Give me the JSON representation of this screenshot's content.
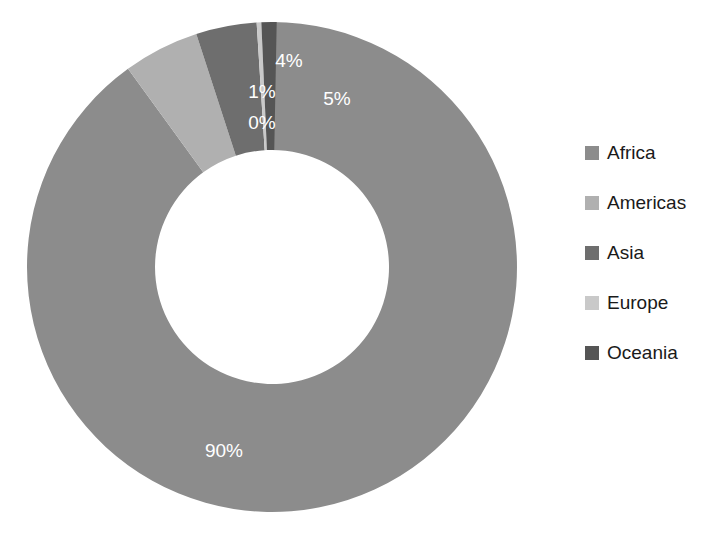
{
  "chart_data": {
    "type": "pie",
    "variant": "donut",
    "title": "",
    "subtitle": "",
    "xlabel": "",
    "ylabel": "",
    "grid": false,
    "legend_position": "right",
    "start_angle_deg": 0,
    "direction": "clockwise",
    "categories": [
      "Africa",
      "Americas",
      "Asia",
      "Europe",
      "Oceania"
    ],
    "values": [
      90,
      5,
      4,
      0,
      1
    ],
    "value_labels": [
      "90%",
      "5%",
      "4%",
      "0%",
      "1%"
    ],
    "colors": [
      "#8c8c8c",
      "#b0b0b0",
      "#6e6e6e",
      "#c9c9c9",
      "#555555"
    ],
    "slices": [
      {
        "name": "Africa",
        "value": 90,
        "label": "90%",
        "color": "#8c8c8c"
      },
      {
        "name": "Americas",
        "value": 5,
        "label": "5%",
        "color": "#b0b0b0"
      },
      {
        "name": "Asia",
        "value": 4,
        "label": "4%",
        "color": "#6e6e6e"
      },
      {
        "name": "Europe",
        "value": 0,
        "label": "0%",
        "color": "#c9c9c9"
      },
      {
        "name": "Oceania",
        "value": 1,
        "label": "1%",
        "color": "#555555"
      }
    ],
    "label_positions": [
      {
        "label": "90%",
        "x": 224,
        "y": 452
      },
      {
        "label": "5%",
        "x": 337,
        "y": 100
      },
      {
        "label": "4%",
        "x": 289,
        "y": 62
      },
      {
        "label": "0%",
        "x": 262,
        "y": 124
      },
      {
        "label": "1%",
        "x": 262,
        "y": 93
      }
    ],
    "geometry": {
      "center_x": 272,
      "center_y": 267,
      "outer_radius": 245,
      "inner_radius": 117
    }
  },
  "legend": {
    "items": [
      {
        "label": "Africa",
        "color": "#8c8c8c"
      },
      {
        "label": "Americas",
        "color": "#b0b0b0"
      },
      {
        "label": "Asia",
        "color": "#6e6e6e"
      },
      {
        "label": "Europe",
        "color": "#c9c9c9"
      },
      {
        "label": "Oceania",
        "color": "#555555"
      }
    ],
    "swatch_x": 585,
    "swatch_size": 14,
    "label_x": 607,
    "start_y": 153,
    "row_spacing": 50
  }
}
